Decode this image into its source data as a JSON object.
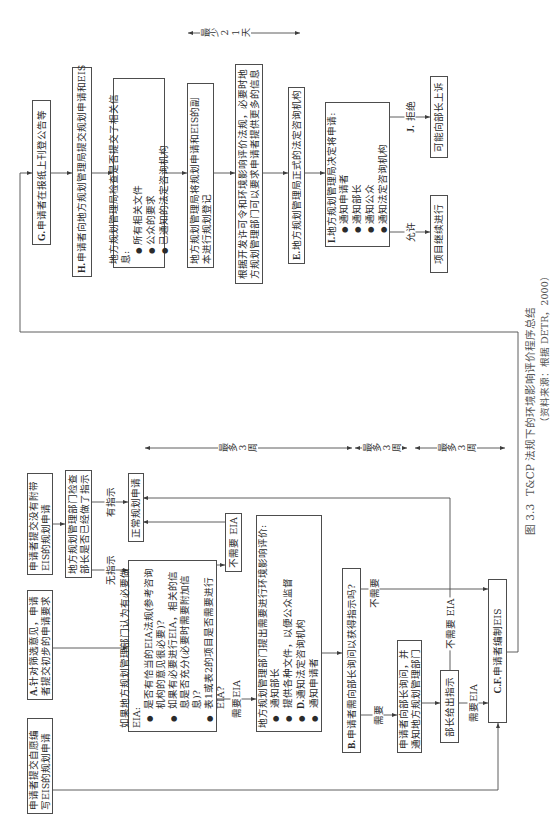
{
  "figure": {
    "caption": {
      "label": "图 3.3",
      "title": "T&CP 法规下的环境影响评价程序总结",
      "source": "（资料来源：根据 DETR，2000）"
    },
    "nodes": {
      "voluntary_eis": {
        "text": "申请者提交自愿编写EIS的规划申请"
      },
      "screening_request": {
        "tag": "A.",
        "text": "针对筛选意见，申请者提交初步的申请要求"
      },
      "no_eis_application": {
        "text": "申请者提交没有附带EIS的规划申请"
      },
      "check_direction": {
        "text": "地方规划管理部门检查部长是否已经做了指示"
      },
      "normal_application": {
        "text": "正常规划申请"
      },
      "lpa_screening": {
        "text": "如果地方规划管理部门认为有必要做EIA:",
        "bullets": [
          "是否有恰当的EIA法规(参考咨询机构的意见很必要)?",
          "如果有必要进行EIA，相关的信息是否充分(必要时需要附加信息)?",
          "表1或表2的项目是否需要进行EIA?"
        ]
      },
      "no_eia": {
        "text": "不需要 EIA"
      },
      "eia_required": {
        "text": "地方规划管理部门提出需要进行环境影响评价:",
        "bullets": [
          {
            "tag": "",
            "text": "通知部长"
          },
          {
            "tag": "",
            "text": "提供各种文件，以便公众监督"
          },
          {
            "tag": "D.",
            "text": "通知法定咨询机构"
          },
          {
            "tag": "",
            "text": "通知申请者"
          }
        ]
      },
      "ask_minister": {
        "tag": "B.",
        "text": "申请者需向部长询问以获得指示吗?"
      },
      "applicant_asks": {
        "text": "申请者向部长询问，并通知地方规划管理部门"
      },
      "minister_direction": {
        "text": "部长给出指示"
      },
      "prepare_eis": {
        "tag": "C.F.",
        "text": "申请者编制EIS"
      },
      "publish_notice": {
        "tag": "G.",
        "text": "申请者在报纸上刊登公告等"
      },
      "submit_application": {
        "tag": "H.",
        "text": "申请者向地方规划管理局提交规划申请和EIS"
      },
      "check_info": {
        "text": "地方规划管理局检查是否提交了相关信息:",
        "bullets": [
          "所有相关文件",
          "公众的要求",
          "已通知的法定咨询机构"
        ]
      },
      "register": {
        "text": "地方规划管理局将规划申请和EIS的副本进行规划登记"
      },
      "more_info": {
        "text": "根据开发许可令和环境影响评价法规，必要时地方规划管理部门可以要求申请者提供更多的信息"
      },
      "consult": {
        "tag": "E.",
        "text": "地方规划管理局正式的法定咨询机构"
      },
      "decision": {
        "tag": "I.",
        "text": "地方规划管理局决定将申请:",
        "bullets": [
          "通知申请者",
          "通知部长",
          "通知公众",
          "通知法定咨询机构"
        ]
      },
      "proceed": {
        "text": "项目继续进行"
      },
      "appeal": {
        "text": "可能向部长上诉"
      }
    },
    "edge_labels": {
      "has_direction": "有指示",
      "no_direction": "无指示",
      "need_eia": "需要EIA",
      "need": "需要",
      "not_need": "不需要",
      "minister_need_eia": "需要EIA",
      "minister_no_eia": "不需要 EIA",
      "refuse": {
        "tag": "J.",
        "text": "拒绝"
      },
      "allow": "允许"
    },
    "time_markers": {
      "minimum": "最少21天",
      "maximum": [
        "最多3周",
        "最多3周",
        "最多3周"
      ]
    }
  }
}
